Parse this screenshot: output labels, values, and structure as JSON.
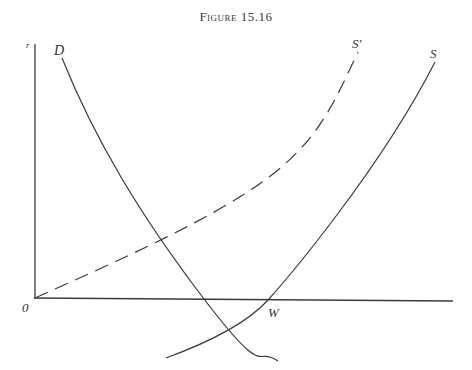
{
  "figure": {
    "title": "Figure 15.16"
  },
  "axes": {
    "y_label": "r",
    "origin_label": "0"
  },
  "curves": {
    "demand": {
      "label": "D",
      "style": "solid"
    },
    "supply_shifted": {
      "label": "S'",
      "style": "dashed"
    },
    "supply": {
      "label": "S",
      "style": "solid"
    }
  },
  "points": {
    "w_label": "W"
  },
  "colors": {
    "line": "#3a3a3a",
    "background": "#ffffff"
  }
}
